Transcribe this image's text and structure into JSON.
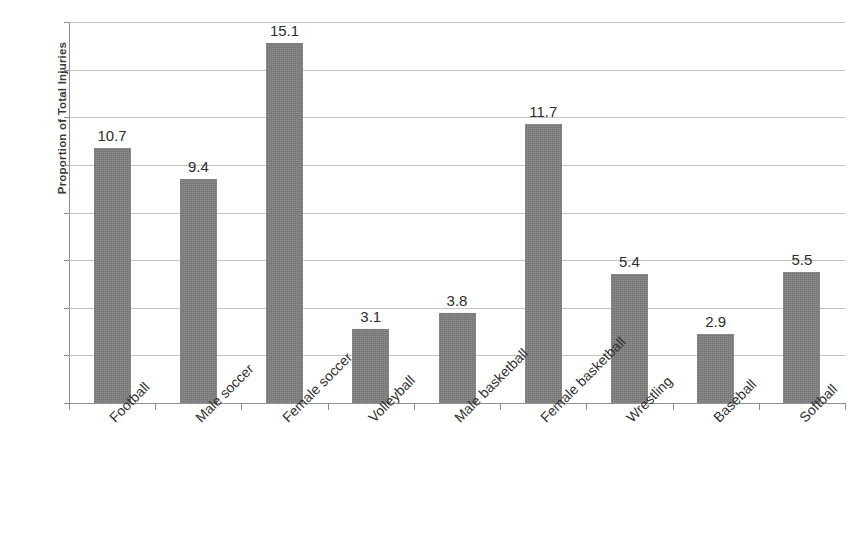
{
  "chart_data": {
    "type": "bar",
    "title": "",
    "xlabel": "",
    "ylabel": "Proportion of Total Injuries",
    "ylim": [
      0,
      16
    ],
    "ytick_values": [
      16,
      14,
      12,
      10,
      8,
      6,
      4,
      2,
      0
    ],
    "ytick_labels": [
      "16",
      "14",
      "12",
      "10",
      "8",
      "6",
      "4",
      "2",
      "0"
    ],
    "grid": true,
    "legend": "none",
    "bar_color": "#7f7f7f",
    "categories": [
      "Football",
      "Male soccer",
      "Female soccer",
      "Volleyball",
      "Male basketball",
      "Female basketball",
      "Wrestling",
      "Baseball",
      "Softball"
    ],
    "values": [
      10.7,
      9.4,
      15.1,
      3.1,
      3.8,
      11.7,
      5.4,
      2.9,
      5.5
    ],
    "value_labels": [
      "10.7",
      "9.4",
      "15.1",
      "3.1",
      "3.8",
      "11.7",
      "5.4",
      "2.9",
      "5.5"
    ]
  },
  "caption": {
    "text": ""
  }
}
